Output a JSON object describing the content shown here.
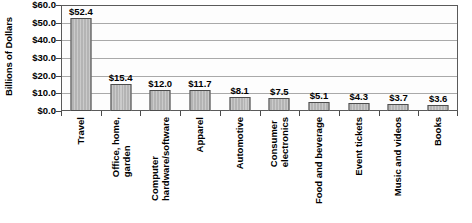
{
  "chart_data": {
    "type": "bar",
    "title": "",
    "xlabel": "",
    "ylabel": "Billions of Dollars",
    "ylim": [
      0,
      60
    ],
    "ytick_step": 10,
    "grid": true,
    "legend": "none",
    "value_label_prefix": "$",
    "categories": [
      "Travel",
      "Office, home, garden",
      "Computer hardware/software",
      "Apparel",
      "Automotive",
      "Consumer electronics",
      "Food and beverage",
      "Event tickets",
      "Music and videos",
      "Books"
    ],
    "category_lines": [
      [
        "Travel"
      ],
      [
        "Office, home,",
        "garden"
      ],
      [
        "Computer",
        "hardware/software"
      ],
      [
        "Apparel"
      ],
      [
        "Automotive"
      ],
      [
        "Consumer",
        "electronics"
      ],
      [
        "Food and beverage"
      ],
      [
        "Event tickets"
      ],
      [
        "Music and videos"
      ],
      [
        "Books"
      ]
    ],
    "values": [
      52.4,
      15.4,
      12.0,
      11.7,
      8.1,
      7.5,
      5.1,
      4.3,
      3.7,
      3.6
    ],
    "value_labels": [
      "$52.4",
      "$15.4",
      "$12.0",
      "$11.7",
      "$8.1",
      "$7.5",
      "$5.1",
      "$4.3",
      "$3.7",
      "$3.6"
    ],
    "ytick_labels": [
      "$60.0",
      "$50.0",
      "$40.0",
      "$30.0",
      "$20.0",
      "$10.0",
      "$0.0"
    ],
    "ytick_values": [
      60,
      50,
      40,
      30,
      20,
      10,
      0
    ],
    "colors": {
      "bar_fill": "#b4b4b4",
      "bar_border": "#4d4d4d",
      "gridline": "#a9a9a9",
      "axis": "#5a5a5a",
      "plot_background": "#fdfdfd",
      "text": "#000000"
    }
  },
  "caption": {
    "bottom_text": ""
  }
}
